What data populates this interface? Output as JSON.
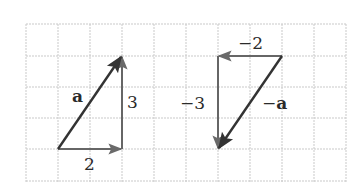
{
  "figure": {
    "grid": {
      "columns": 10,
      "rows": 5,
      "cell_px": 32,
      "line_color": "#c8c8c8",
      "style": "dashed"
    },
    "vector_color": "#3a3a3a",
    "component_color": "#555555",
    "left_triangle": {
      "vector_label": "a",
      "horizontal_label": "2",
      "vertical_label": "3",
      "vector": {
        "from": [
          0,
          0
        ],
        "to": [
          2,
          3
        ]
      },
      "horizontal": {
        "from": [
          0,
          0
        ],
        "to": [
          2,
          0
        ]
      },
      "vertical": {
        "from": [
          2,
          0
        ],
        "to": [
          2,
          3
        ]
      }
    },
    "right_triangle": {
      "vector_label": "−a",
      "vector_minus": "−",
      "vector_name": "a",
      "horizontal_label": "−2",
      "vertical_label": "−3",
      "vector": {
        "from": [
          0,
          0
        ],
        "to": [
          -2,
          -3
        ]
      },
      "horizontal": {
        "from": [
          0,
          0
        ],
        "to": [
          -2,
          0
        ]
      },
      "vertical": {
        "from": [
          -2,
          0
        ],
        "to": [
          -2,
          -3
        ]
      }
    }
  }
}
